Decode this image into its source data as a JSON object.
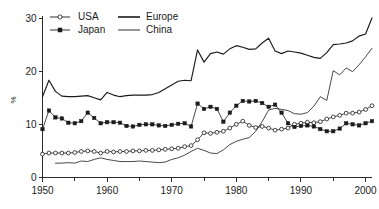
{
  "chart_data": {
    "type": "line",
    "title": "",
    "subtitle": "",
    "xlabel": "",
    "ylabel": "%",
    "xlim": [
      1950,
      2001
    ],
    "ylim": [
      0,
      30
    ],
    "grid": false,
    "legend_position": "top-left",
    "x_ticks": [
      "1950",
      "1960",
      "1970",
      "1980",
      "1990",
      "2000"
    ],
    "x_tick_values": [
      1950,
      1960,
      1970,
      1980,
      1990,
      2000
    ],
    "x_minor_tick_values": [
      1955,
      1965,
      1975,
      1985,
      1995
    ],
    "y_ticks": [
      "0",
      "10",
      "20",
      "30"
    ],
    "y_tick_values": [
      0,
      10,
      20,
      30
    ],
    "series": [
      {
        "name": "USA",
        "marker": "open-circle",
        "line_style": "thin-with-markers",
        "x": [
          1950,
          1951,
          1952,
          1953,
          1954,
          1955,
          1956,
          1957,
          1958,
          1959,
          1960,
          1961,
          1962,
          1963,
          1964,
          1965,
          1966,
          1967,
          1968,
          1969,
          1970,
          1971,
          1972,
          1973,
          1974,
          1975,
          1976,
          1977,
          1978,
          1979,
          1980,
          1981,
          1982,
          1983,
          1984,
          1985,
          1986,
          1987,
          1988,
          1989,
          1990,
          1991,
          1992,
          1993,
          1994,
          1995,
          1996,
          1997,
          1998,
          1999,
          2000,
          2001
        ],
        "values": [
          4.4,
          4.6,
          4.6,
          4.6,
          4.6,
          4.7,
          4.9,
          5.0,
          4.9,
          4.6,
          4.9,
          4.8,
          4.9,
          4.9,
          5.0,
          5.0,
          5.1,
          5.1,
          5.2,
          5.3,
          5.4,
          5.5,
          5.8,
          6.0,
          7.1,
          8.4,
          8.3,
          8.5,
          8.7,
          9.3,
          10.0,
          10.6,
          9.8,
          9.4,
          9.6,
          9.3,
          8.9,
          9.1,
          9.3,
          10.0,
          10.2,
          10.4,
          10.3,
          10.5,
          11.0,
          11.4,
          11.7,
          12.1,
          12.1,
          12.3,
          12.8,
          13.5
        ]
      },
      {
        "name": "Japan",
        "marker": "filled-square",
        "line_style": "thin-with-markers",
        "x": [
          1950,
          1951,
          1952,
          1953,
          1954,
          1955,
          1956,
          1957,
          1958,
          1959,
          1960,
          1961,
          1962,
          1963,
          1964,
          1965,
          1966,
          1967,
          1968,
          1969,
          1970,
          1971,
          1972,
          1973,
          1974,
          1975,
          1976,
          1977,
          1978,
          1979,
          1980,
          1981,
          1982,
          1983,
          1984,
          1985,
          1986,
          1987,
          1988,
          1989,
          1990,
          1991,
          1992,
          1993,
          1994,
          1995,
          1996,
          1997,
          1998,
          1999,
          2000,
          2001
        ],
        "values": [
          9.1,
          12.6,
          11.3,
          11.1,
          10.3,
          10.2,
          10.6,
          12.2,
          11.2,
          10.2,
          10.4,
          10.4,
          10.3,
          9.7,
          9.6,
          9.9,
          10.0,
          10.0,
          9.8,
          9.7,
          9.9,
          10.1,
          10.2,
          9.6,
          13.9,
          12.9,
          13.3,
          12.9,
          10.5,
          12.2,
          13.5,
          14.4,
          14.3,
          14.4,
          14.0,
          13.3,
          13.7,
          12.2,
          10.2,
          9.5,
          9.7,
          9.8,
          9.6,
          9.1,
          8.7,
          8.7,
          9.2,
          10.2,
          10.0,
          9.8,
          10.2,
          10.6
        ]
      },
      {
        "name": "Europe",
        "marker": "none",
        "line_style": "medium",
        "x": [
          1950,
          1951,
          1952,
          1953,
          1954,
          1955,
          1956,
          1957,
          1958,
          1959,
          1960,
          1961,
          1962,
          1963,
          1964,
          1965,
          1966,
          1967,
          1968,
          1969,
          1970,
          1971,
          1972,
          1973,
          1974,
          1975,
          1976,
          1977,
          1978,
          1979,
          1980,
          1981,
          1982,
          1983,
          1984,
          1985,
          1986,
          1987,
          1988,
          1989,
          1990,
          1991,
          1992,
          1993,
          1994,
          1995,
          1996,
          1997,
          1998,
          1999,
          2000,
          2001
        ],
        "values": [
          15.2,
          18.3,
          16.2,
          15.3,
          15.2,
          15.2,
          15.3,
          15.4,
          15.0,
          14.6,
          16.0,
          15.5,
          15.2,
          15.4,
          15.5,
          15.5,
          15.5,
          15.6,
          16.0,
          16.7,
          17.4,
          18.1,
          18.3,
          18.2,
          24.0,
          21.7,
          23.3,
          23.6,
          23.2,
          24.2,
          24.8,
          24.5,
          24.1,
          24.2,
          25.3,
          26.2,
          23.8,
          23.3,
          23.8,
          23.6,
          23.4,
          23.0,
          22.6,
          22.4,
          23.5,
          25.0,
          25.1,
          25.3,
          25.7,
          26.6,
          27.0,
          30.0
        ]
      },
      {
        "name": "China",
        "marker": "none",
        "line_style": "thin",
        "x": [
          1952,
          1953,
          1954,
          1955,
          1956,
          1957,
          1958,
          1959,
          1960,
          1961,
          1962,
          1963,
          1964,
          1965,
          1966,
          1967,
          1968,
          1969,
          1970,
          1971,
          1972,
          1973,
          1974,
          1975,
          1976,
          1977,
          1978,
          1979,
          1980,
          1981,
          1982,
          1983,
          1984,
          1985,
          1986,
          1987,
          1988,
          1989,
          1990,
          1991,
          1992,
          1993,
          1994,
          1995,
          1996,
          1997,
          1998,
          1999,
          2000,
          2001
        ],
        "values": [
          2.7,
          2.7,
          2.8,
          2.7,
          3.1,
          3.0,
          3.4,
          3.7,
          3.4,
          3.2,
          3.0,
          3.0,
          3.0,
          3.1,
          3.0,
          2.9,
          2.8,
          2.9,
          3.4,
          3.7,
          4.2,
          4.9,
          5.5,
          5.1,
          4.6,
          4.5,
          5.2,
          6.2,
          6.8,
          7.2,
          7.5,
          8.7,
          10.5,
          12.7,
          13.0,
          12.8,
          12.6,
          12.0,
          11.9,
          12.2,
          13.4,
          15.2,
          14.5,
          20.1,
          19.3,
          20.6,
          19.9,
          21.2,
          22.7,
          24.3
        ]
      }
    ]
  },
  "legend": {
    "items": [
      {
        "label": "USA",
        "style": "open-circle-line"
      },
      {
        "label": "Europe",
        "style": "medium-line"
      },
      {
        "label": "Japan",
        "style": "filled-square-line"
      },
      {
        "label": "China",
        "style": "thin-line"
      }
    ]
  },
  "axes": {
    "y_axis_title": "%"
  }
}
